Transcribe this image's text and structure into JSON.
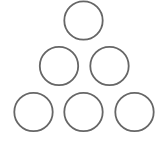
{
  "diagram": {
    "background": "#ffffff",
    "stroke_color": "#666666",
    "stroke_width": 1.8,
    "fill": "none",
    "arrangement": "triangle",
    "rows": [
      {
        "row": 1,
        "circles": [
          {
            "cx": 83.5,
            "cy": 20.5,
            "r": 19.2
          }
        ]
      },
      {
        "row": 2,
        "circles": [
          {
            "cx": 59,
            "cy": 66,
            "r": 19.2
          },
          {
            "cx": 109.5,
            "cy": 66,
            "r": 19.2
          }
        ]
      },
      {
        "row": 3,
        "circles": [
          {
            "cx": 33.5,
            "cy": 112,
            "r": 19.2
          },
          {
            "cx": 83.5,
            "cy": 112,
            "r": 19.2
          },
          {
            "cx": 134.5,
            "cy": 112,
            "r": 19.2
          }
        ]
      }
    ]
  }
}
